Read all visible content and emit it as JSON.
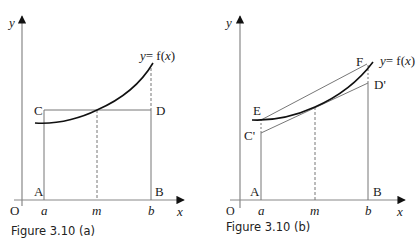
{
  "figure_a": {
    "caption": "Figure 3.10 (a)",
    "axis_y_label": "y",
    "axis_x_label": "x",
    "origin_label": "O",
    "curve_label_y": "y",
    "curve_label_eq": "= f(",
    "curve_label_x": "x",
    "curve_label_close": ")",
    "point_labels": {
      "A": "A",
      "B": "B",
      "C": "C",
      "D": "D"
    },
    "tick_labels": {
      "a": "a",
      "m": "m",
      "b": "b"
    }
  },
  "figure_b": {
    "caption": "Figure 3.10 (b)",
    "axis_y_label": "y",
    "axis_x_label": "x",
    "origin_label": "O",
    "curve_label_y": "y",
    "curve_label_eq": "= f(",
    "curve_label_x": "x",
    "curve_label_close": ")",
    "point_labels": {
      "A": "A",
      "B": "B",
      "C": "C'",
      "D": "D'",
      "E": "E",
      "F": "F"
    },
    "tick_labels": {
      "a": "a",
      "m": "m",
      "b": "b"
    }
  },
  "colors": {
    "axis": "#888888",
    "curve": "#111111",
    "line": "#777777",
    "dash": "#777777",
    "text": "#222222"
  }
}
